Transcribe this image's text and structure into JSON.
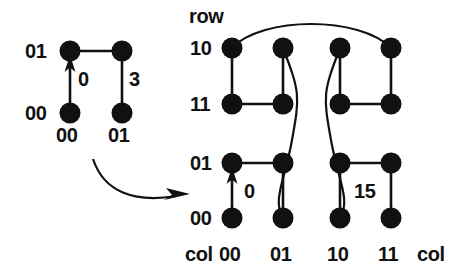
{
  "figure": {
    "title": "",
    "background_color": "#ffffff",
    "ink_color": "#111111",
    "left_graph": {
      "name": "2x2-grid-graph",
      "row_labels": [
        "01",
        "00"
      ],
      "col_labels": [
        "00",
        "01"
      ],
      "edge_labels": [
        {
          "text": "0",
          "edge": "col00-vertical"
        },
        {
          "text": "3",
          "edge": "col01-vertical"
        }
      ],
      "nodes": [
        {
          "row": "01",
          "col": "00"
        },
        {
          "row": "01",
          "col": "01"
        },
        {
          "row": "00",
          "col": "00"
        },
        {
          "row": "00",
          "col": "01"
        }
      ]
    },
    "transform_arrow": {
      "name": "expansion-arrow",
      "direction": "right"
    },
    "right_graph": {
      "name": "4x4-grid-graph",
      "axis_title_row": "row",
      "axis_title_col_left": "col",
      "axis_title_col_right": "col",
      "row_labels": [
        "10",
        "11",
        "01",
        "00"
      ],
      "col_labels": [
        "00",
        "01",
        "10",
        "11"
      ],
      "edge_labels": [
        {
          "text": "0",
          "edge": "col00-row01-row00-vertical"
        },
        {
          "text": "15",
          "edge": "col11-row01-row00-vertical"
        }
      ],
      "nodes": [
        {
          "row": "10",
          "col": "00"
        },
        {
          "row": "10",
          "col": "01"
        },
        {
          "row": "10",
          "col": "10"
        },
        {
          "row": "10",
          "col": "11"
        },
        {
          "row": "11",
          "col": "00"
        },
        {
          "row": "11",
          "col": "01"
        },
        {
          "row": "11",
          "col": "10"
        },
        {
          "row": "11",
          "col": "11"
        },
        {
          "row": "01",
          "col": "00"
        },
        {
          "row": "01",
          "col": "01"
        },
        {
          "row": "01",
          "col": "10"
        },
        {
          "row": "01",
          "col": "11"
        },
        {
          "row": "00",
          "col": "00"
        },
        {
          "row": "00",
          "col": "01"
        },
        {
          "row": "00",
          "col": "10"
        },
        {
          "row": "00",
          "col": "11"
        }
      ]
    }
  }
}
